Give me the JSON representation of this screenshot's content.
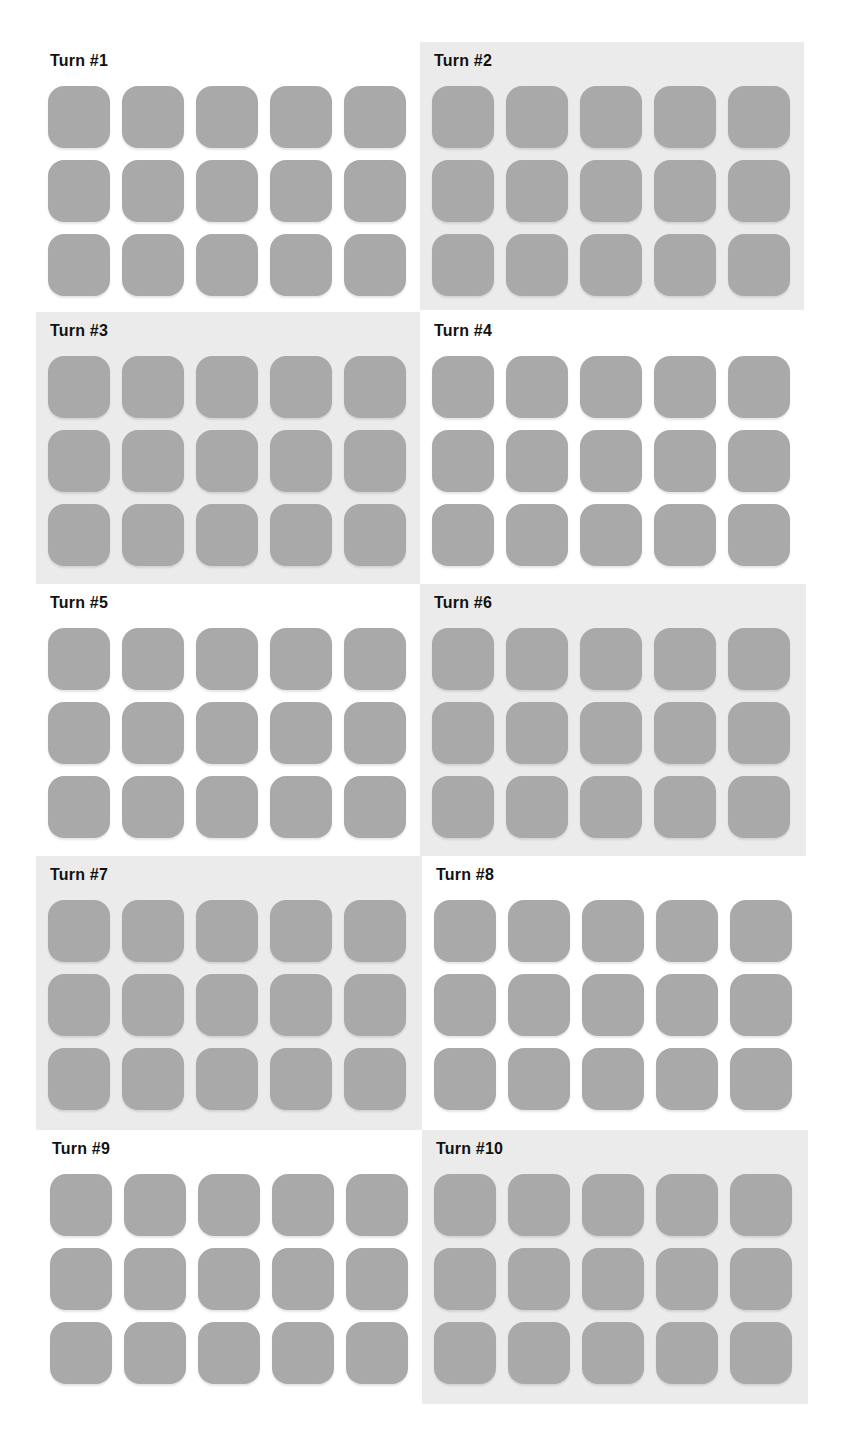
{
  "colors": {
    "tile": "#a9a9a9",
    "panel_shaded": "#ebebeb",
    "panel_plain": "#ffffff",
    "title_text": "#111111"
  },
  "panels": [
    {
      "title": "Turn #1",
      "shaded": false,
      "rows": 3,
      "cols": 5
    },
    {
      "title": "Turn #2",
      "shaded": true,
      "rows": 3,
      "cols": 5
    },
    {
      "title": "Turn #3",
      "shaded": true,
      "rows": 3,
      "cols": 5
    },
    {
      "title": "Turn #4",
      "shaded": false,
      "rows": 3,
      "cols": 5
    },
    {
      "title": "Turn #5",
      "shaded": false,
      "rows": 3,
      "cols": 5
    },
    {
      "title": "Turn #6",
      "shaded": true,
      "rows": 3,
      "cols": 5
    },
    {
      "title": "Turn #7",
      "shaded": true,
      "rows": 3,
      "cols": 5
    },
    {
      "title": "Turn #8",
      "shaded": false,
      "rows": 3,
      "cols": 5
    },
    {
      "title": "Turn #9",
      "shaded": false,
      "rows": 3,
      "cols": 5
    },
    {
      "title": "Turn #10",
      "shaded": true,
      "rows": 3,
      "cols": 5
    }
  ]
}
